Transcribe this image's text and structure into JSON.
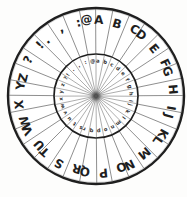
{
  "figure": {
    "type": "cipher-wheel",
    "segments": 32,
    "outer_ring": [
      "A",
      "B",
      "C",
      "D",
      "E",
      "F",
      "G",
      "H",
      "I",
      "J",
      "K",
      "L",
      "M",
      "N",
      "O",
      "P",
      "Q",
      "R",
      "S",
      "T",
      "U",
      "V",
      "W",
      "X",
      "Y",
      "Z",
      "?",
      "!",
      ".",
      ",",
      ":",
      "@"
    ],
    "inner_ring": [
      "a",
      "b",
      "c",
      "d",
      "e",
      "f",
      "g",
      "h",
      "i",
      "j",
      "k",
      "l",
      "m",
      "n",
      "o",
      "p",
      "q",
      "r",
      "s",
      "t",
      "u",
      "v",
      "w",
      "x",
      "y",
      "z",
      "?",
      "!",
      ".",
      ",",
      ":",
      "@"
    ],
    "alignment": {
      "outer_at_top": "A",
      "inner_at_top": "a"
    },
    "colors": {
      "ink": "#1f1f1f",
      "outer_spoke": "#4f4f4f",
      "inner_spoke": "#5a5a5a",
      "inner_text": "#2e2e2e",
      "paper": "#ffffff",
      "pivot": "#4a4a4a",
      "background": "#fdfdfc"
    }
  }
}
